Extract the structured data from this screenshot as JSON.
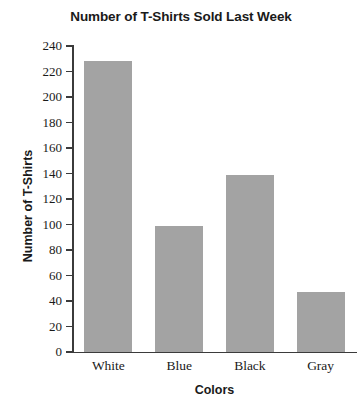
{
  "chart_data": {
    "type": "bar",
    "title": "Number of T-Shirts Sold Last Week",
    "xlabel": "Colors",
    "ylabel": "Number of T-Shirts",
    "categories": [
      "White",
      "Blue",
      "Black",
      "Gray"
    ],
    "values": [
      228,
      99,
      139,
      47
    ],
    "ylim": [
      0,
      240
    ],
    "ytick_step": 20,
    "yticks": [
      0,
      20,
      40,
      60,
      80,
      100,
      120,
      140,
      160,
      180,
      200,
      220,
      240
    ],
    "ytick_labels": [
      "0",
      "20",
      "40",
      "60",
      "80",
      "100",
      "120",
      "140",
      "160",
      "180",
      "200",
      "220",
      "240"
    ],
    "grid": false,
    "legend": null,
    "bar_color": "#a3a3a3",
    "axis_color": "#3b3b3b",
    "text_color": "#1a1a1a"
  }
}
